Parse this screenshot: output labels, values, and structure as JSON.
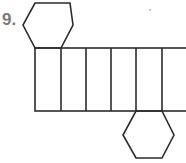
{
  "problem": {
    "number_label": "9."
  },
  "figure": {
    "type": "net-of-hexagonal-prism",
    "stroke_color": "#2b2b2b",
    "stroke_width": 1.6,
    "top_hexagon": {
      "points": [
        [
          35,
          3
        ],
        [
          70,
          3
        ],
        [
          73,
          25
        ],
        [
          61,
          48
        ],
        [
          35,
          48
        ],
        [
          23,
          25
        ]
      ]
    },
    "rectangle_strip": {
      "x": 35,
      "y": 48,
      "right": 190,
      "bottom": 111,
      "dividers_x": [
        61,
        86,
        111,
        136,
        162
      ],
      "face_count": 6
    },
    "bottom_hexagon": {
      "points": [
        [
          136,
          111
        ],
        [
          162,
          111
        ],
        [
          174,
          135
        ],
        [
          162,
          158
        ],
        [
          136,
          158
        ],
        [
          123,
          135
        ]
      ]
    }
  }
}
